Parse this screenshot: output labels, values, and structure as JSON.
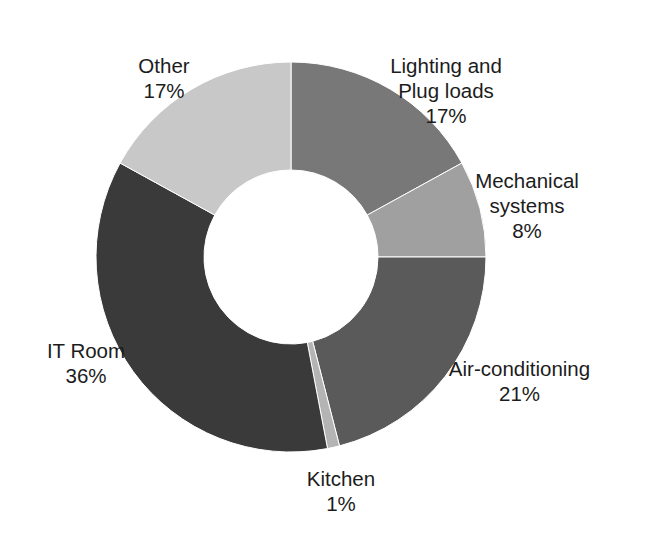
{
  "chart_data": {
    "type": "pie",
    "variant": "donut",
    "title": "",
    "subtitle": "",
    "xlabel": "",
    "ylabel": "",
    "grid": false,
    "legend_position": "none",
    "labels_position": "outside",
    "start_angle_deg": 0,
    "direction": "clockwise",
    "units": "percent",
    "total": 100,
    "categories": [
      "Lighting and Plug loads",
      "Mechanical systems",
      "Air-conditioning",
      "Kitchen",
      "IT Room",
      "Other"
    ],
    "values": [
      17,
      8,
      21,
      1,
      36,
      17
    ],
    "colors": [
      "#787878",
      "#a0a0a0",
      "#5a5a5a",
      "#b4b4b4",
      "#3a3a3a",
      "#c8c8c8"
    ],
    "slices": [
      {
        "name": "Lighting and Plug loads",
        "name_line1": "Lighting and",
        "name_line2": "Plug loads",
        "value": 17,
        "value_label": "17%",
        "color": "#787878"
      },
      {
        "name": "Mechanical systems",
        "name_line1": "Mechanical",
        "name_line2": "systems",
        "value": 8,
        "value_label": "8%",
        "color": "#a0a0a0"
      },
      {
        "name": "Air-conditioning",
        "name_line1": "Air-conditioning",
        "name_line2": "",
        "value": 21,
        "value_label": "21%",
        "color": "#5a5a5a"
      },
      {
        "name": "Kitchen",
        "name_line1": "Kitchen",
        "name_line2": "",
        "value": 1,
        "value_label": "1%",
        "color": "#b4b4b4"
      },
      {
        "name": "IT Room",
        "name_line1": "IT Room",
        "name_line2": "",
        "value": 36,
        "value_label": "36%",
        "color": "#3a3a3a"
      },
      {
        "name": "Other",
        "name_line1": "Other",
        "name_line2": "",
        "value": 17,
        "value_label": "17%",
        "color": "#c8c8c8"
      }
    ],
    "geometry": {
      "center_x": 291,
      "center_y": 257,
      "outer_radius": 195,
      "inner_radius": 87
    },
    "background_color": "#ffffff",
    "text_color": "#1c1c1c"
  }
}
